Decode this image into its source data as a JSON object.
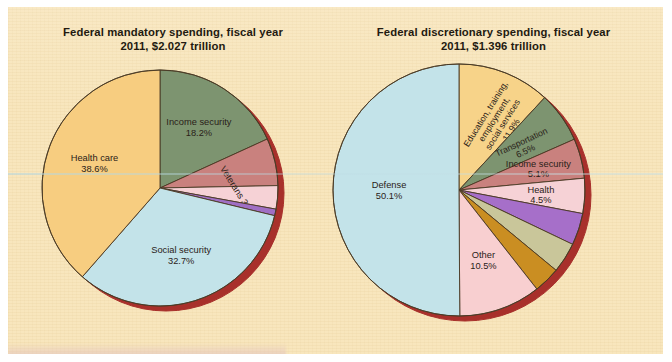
{
  "figure": {
    "background_color": "#f8e6bd",
    "rim_color": "#a8302b",
    "outline_color": "#4a3a25"
  },
  "chart_data": [
    {
      "type": "pie",
      "id": "federal-mandatory-spending",
      "title_line1": "Federal mandatory spending, fiscal year",
      "title_line2": "2011, $2.027 trillion",
      "total_label": "$2.027 trillion",
      "fiscal_year": "2011",
      "start_angle_deg": -90,
      "direction": "clockwise",
      "units": "percent",
      "categories": [
        "Income security",
        "Federal civilian and military retirement",
        "Veterans",
        "Other",
        "Social security",
        "Health care"
      ],
      "values": [
        18.2,
        6.5,
        3.2,
        0.9,
        32.7,
        38.6
      ],
      "slices": [
        {
          "label": "Income security",
          "pct_text": "18.2%",
          "value": 18.2,
          "color": "#7d9470",
          "label_placement": "inside",
          "label_lines": [
            "Income security",
            "18.2%"
          ]
        },
        {
          "label": "Federal civilian and military retirement",
          "pct_text": "6.5%",
          "value": 6.5,
          "color": "#c9817e",
          "label_placement": "outside",
          "label_lines": [
            "Federal civilian and",
            "military retirement",
            "6.5%"
          ]
        },
        {
          "label": "Veterans",
          "pct_text": "3.2%",
          "value": 3.2,
          "color": "#f6d2d6",
          "label_placement": "inside-rotated",
          "label_lines": [
            "Veterans 3.2%"
          ]
        },
        {
          "label": "Other",
          "pct_text": "0.9%",
          "value": 0.9,
          "color": "#a06fc4",
          "label_placement": "outside",
          "label_lines": [
            "Other",
            "0.9%"
          ]
        },
        {
          "label": "Social security",
          "pct_text": "32.7%",
          "value": 32.7,
          "color": "#c3e3e9",
          "label_placement": "inside",
          "label_lines": [
            "Social security",
            "32.7%"
          ]
        },
        {
          "label": "Health care",
          "pct_text": "38.6%",
          "value": 38.6,
          "color": "#f7cd80",
          "label_placement": "inside",
          "label_lines": [
            "Health care",
            "38.6%"
          ]
        }
      ]
    },
    {
      "type": "pie",
      "id": "federal-discretionary-spending",
      "title_line1": "Federal discretionary spending, fiscal year",
      "title_line2": "2011, $1.396 trillion",
      "total_label": "$1.396 trillion",
      "fiscal_year": "2011",
      "start_angle_deg": -90,
      "direction": "clockwise",
      "units": "percent",
      "categories": [
        "Education, training, employment, social services",
        "Transportation",
        "Income security",
        "Health",
        "Veterans benefits, services",
        "Administration of justice",
        "International affairs",
        "Other",
        "Defense"
      ],
      "values": [
        11.9,
        6.5,
        5.1,
        4.5,
        4.1,
        3.9,
        3.4,
        10.5,
        50.1
      ],
      "slices": [
        {
          "label": "Education, training, employment, social services",
          "pct_text": "11.9%",
          "value": 11.9,
          "color": "#f7d389",
          "label_placement": "inside-rotated",
          "label_lines": [
            "Education, training,",
            "employment,",
            "social services",
            "11.9%"
          ]
        },
        {
          "label": "Transportation",
          "pct_text": "6.5%",
          "value": 6.5,
          "color": "#7d9470",
          "label_placement": "inside-rotated",
          "label_lines": [
            "Transportation",
            "6.5%"
          ]
        },
        {
          "label": "Income security",
          "pct_text": "5.1%",
          "value": 5.1,
          "color": "#c9817e",
          "label_placement": "inside",
          "label_lines": [
            "Income security",
            "5.1%"
          ]
        },
        {
          "label": "Health",
          "pct_text": "4.5%",
          "value": 4.5,
          "color": "#f6d2d6",
          "label_placement": "inside",
          "label_lines": [
            "Health",
            "4.5%"
          ]
        },
        {
          "label": "Veterans benefits, services",
          "pct_text": "4.1%",
          "value": 4.1,
          "color": "#a66fc9",
          "label_placement": "outside",
          "label_lines": [
            "Veterans benefits,",
            "services",
            "4.1%"
          ]
        },
        {
          "label": "Administration of justice",
          "pct_text": "3.9%",
          "value": 3.9,
          "color": "#c9c69a",
          "label_placement": "outside",
          "label_lines": [
            "Administration",
            "of justice",
            "3.9%"
          ]
        },
        {
          "label": "International affairs",
          "pct_text": "3.4%",
          "value": 3.4,
          "color": "#ca8e22",
          "label_placement": "outside",
          "label_lines": [
            "International",
            "affairs",
            "3.4%"
          ]
        },
        {
          "label": "Other",
          "pct_text": "10.5%",
          "value": 10.5,
          "color": "#f8cfd0",
          "label_placement": "inside",
          "label_lines": [
            "Other",
            "10.5%"
          ]
        },
        {
          "label": "Defense",
          "pct_text": "50.1%",
          "value": 50.1,
          "color": "#c3e3e9",
          "label_placement": "inside",
          "label_lines": [
            "Defense",
            "50.1%"
          ]
        }
      ]
    }
  ]
}
